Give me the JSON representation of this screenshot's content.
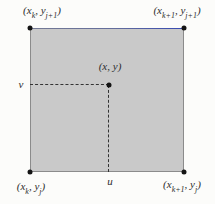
{
  "figure": {
    "colors": {
      "background": "#fcfcfa",
      "square_fill": "#c9c9c9",
      "square_border": "#8b8b8b",
      "top_edge_accent": "#3c50b4",
      "dot": "#141414",
      "dash": "#333333",
      "text": "#2e2e2e"
    },
    "labels": {
      "top_left": {
        "pre": "(x",
        "sub1": "k",
        "mid": ", y",
        "sub2": "j+1",
        "post": ")"
      },
      "top_right": {
        "pre": "(x",
        "sub1": "k+1",
        "mid": ", y",
        "sub2": "j+1",
        "post": ")"
      },
      "bottom_left": {
        "pre": "(x",
        "sub1": "k",
        "mid": ", y",
        "sub2": "j",
        "post": ")"
      },
      "bottom_right": {
        "pre": "(x",
        "sub1": "k+1",
        "mid": ", y",
        "sub2": "j",
        "post": ")"
      },
      "interior_point": "(x, y)",
      "v": "v",
      "u": "u"
    }
  }
}
